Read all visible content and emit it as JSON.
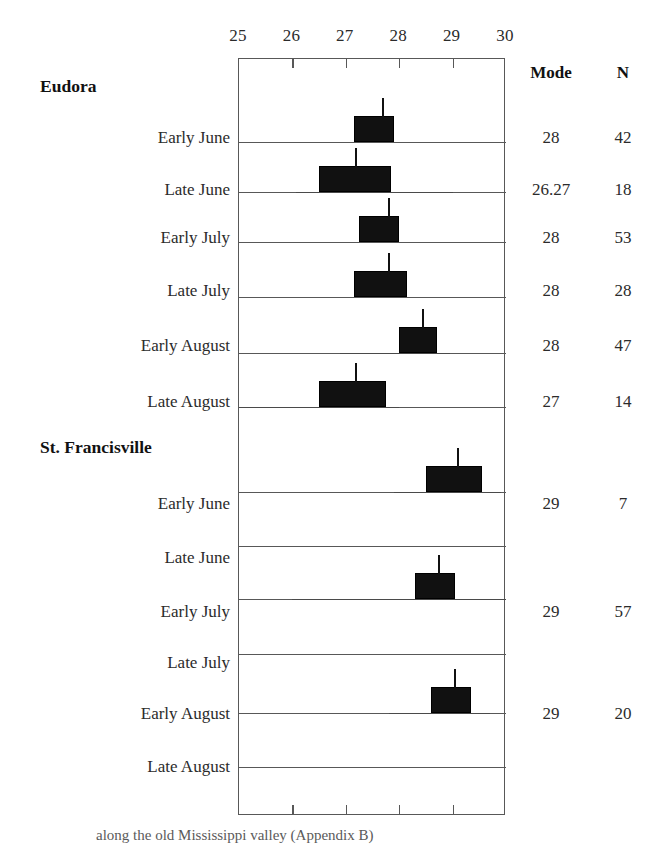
{
  "figure": {
    "caption_fragment": "along the old Mississippi valley (Appendix B)"
  },
  "columns": {
    "mode_header": "Mode",
    "n_header": "N"
  },
  "chart_data": {
    "type": "bar",
    "subtype": "box-and-whisker (horizontal, grouped)",
    "title": "",
    "xlabel": "",
    "ylabel": "",
    "xlim": [
      25,
      30
    ],
    "xticks": [
      25,
      26,
      27,
      28,
      29,
      30
    ],
    "xtick_labels": [
      "25",
      "26",
      "27",
      "28",
      "29",
      "30"
    ],
    "grid": false,
    "legend": null,
    "groups": [
      {
        "name": "Eudora",
        "rows": [
          {
            "label": "Early June",
            "mode": "28",
            "n": "42",
            "box_min": 27.15,
            "box_max": 27.9,
            "whisker_min": 27.15,
            "whisker_max": 27.9,
            "mode_value": 27.7
          },
          {
            "label": "Late June",
            "mode": "26.27",
            "n": "18",
            "box_min": 26.5,
            "box_max": 27.85,
            "whisker_min": 26.07,
            "whisker_max": 29.0,
            "mode_value": 27.2
          },
          {
            "label": "Early July",
            "mode": "28",
            "n": "53",
            "box_min": 27.25,
            "box_max": 28.0,
            "whisker_min": 27.25,
            "whisker_max": 28.0,
            "mode_value": 27.8
          },
          {
            "label": "Late July",
            "mode": "28",
            "n": "28",
            "box_min": 27.15,
            "box_max": 28.15,
            "whisker_min": 27.15,
            "whisker_max": 28.15,
            "mode_value": 27.8
          },
          {
            "label": "Early August",
            "mode": "28",
            "n": "47",
            "box_min": 28.0,
            "box_max": 28.7,
            "whisker_min": 26.9,
            "whisker_max": 28.95,
            "mode_value": 28.45
          },
          {
            "label": "Late August",
            "mode": "27",
            "n": "14",
            "box_min": 26.5,
            "box_max": 27.75,
            "whisker_min": 25.0,
            "whisker_max": 28.0,
            "mode_value": 27.2
          }
        ]
      },
      {
        "name": "St. Francisville",
        "rows": [
          {
            "label": "Early June",
            "mode": "29",
            "n": "7",
            "box_min": 28.5,
            "box_max": 29.55,
            "whisker_min": 27.9,
            "whisker_max": 29.9,
            "mode_value": 29.1
          },
          {
            "label": "Late June",
            "mode": "",
            "n": "",
            "box_min": null,
            "box_max": null,
            "whisker_min": null,
            "whisker_max": null,
            "mode_value": null
          },
          {
            "label": "Early July",
            "mode": "29",
            "n": "57",
            "box_min": 28.3,
            "box_max": 29.05,
            "whisker_min": 26.0,
            "whisker_max": 30.0,
            "mode_value": 28.75
          },
          {
            "label": "Late July",
            "mode": "",
            "n": "",
            "box_min": null,
            "box_max": null,
            "whisker_min": null,
            "whisker_max": null,
            "mode_value": null
          },
          {
            "label": "Early August",
            "mode": "29",
            "n": "20",
            "box_min": 28.6,
            "box_max": 29.35,
            "whisker_min": 27.8,
            "whisker_max": 29.7,
            "mode_value": 29.05
          },
          {
            "label": "Late August",
            "mode": "",
            "n": "",
            "box_min": null,
            "box_max": null,
            "whisker_min": null,
            "whisker_max": null,
            "mode_value": null
          }
        ]
      }
    ]
  }
}
